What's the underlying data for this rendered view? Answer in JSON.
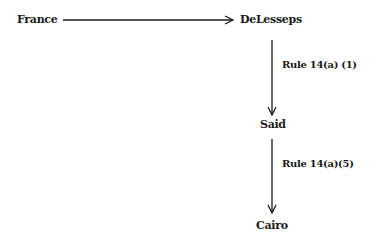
{
  "diagram": {
    "nodes": [
      {
        "id": "france",
        "label": "France"
      },
      {
        "id": "delesseps",
        "label": "DeLesseps"
      },
      {
        "id": "said",
        "label": "Said"
      },
      {
        "id": "cairo",
        "label": "Cairo"
      }
    ],
    "edges": [
      {
        "from": "France",
        "to": "DeLesseps",
        "label": ""
      },
      {
        "from": "DeLesseps",
        "to": "Said",
        "label": "Rule 14(a) (1)"
      },
      {
        "from": "Said",
        "to": "Cairo",
        "label": "Rule 14(a)(5)"
      }
    ]
  }
}
